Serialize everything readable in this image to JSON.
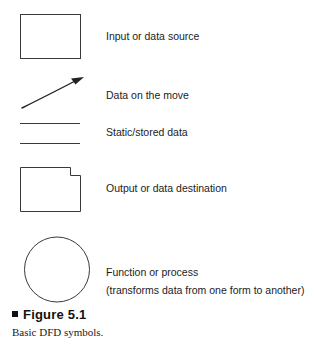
{
  "figure": {
    "background_color": "#ffffff",
    "stroke_color": "#333333",
    "text_color": "#1c1c1c",
    "caption": {
      "bullet": "filled-square-bullet",
      "title": "Figure 5.1",
      "subtitle": "Basic DFD symbols."
    }
  },
  "legend": {
    "items": [
      {
        "symbol": "rectangle",
        "symbol_name": "input-data-source-rectangle",
        "label": "Input or data source"
      },
      {
        "symbol": "curved-arrow",
        "symbol_name": "data-on-the-move-arrow",
        "label": "Data on the move"
      },
      {
        "symbol": "parallel-lines",
        "symbol_name": "static-stored-data-lines",
        "label": "Static/stored data"
      },
      {
        "symbol": "notched-rectangle",
        "symbol_name": "output-data-destination-shape",
        "label": "Output or data destination"
      },
      {
        "symbol": "circle",
        "symbol_name": "function-process-circle",
        "label": "Function or process",
        "sublabel": "(transforms data from one form to another)"
      }
    ]
  }
}
